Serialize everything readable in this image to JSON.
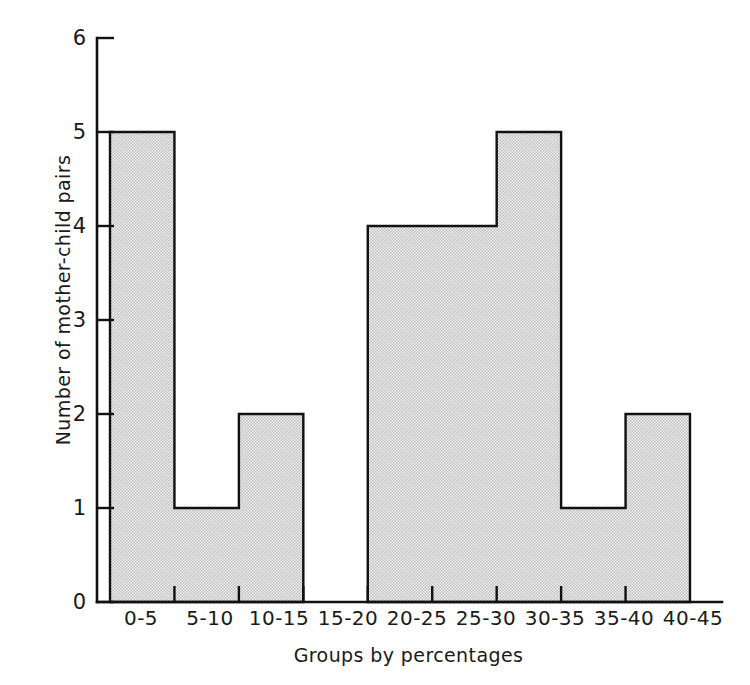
{
  "chart_data": {
    "type": "bar",
    "title": "",
    "xlabel": "Groups by percentages",
    "ylabel": "Number of mother-child pairs",
    "categories": [
      "0-5",
      "5-10",
      "10-15",
      "15-20",
      "20-25",
      "25-30",
      "30-35",
      "35-40",
      "40-45"
    ],
    "values": [
      5,
      1,
      2,
      0,
      4,
      4,
      5,
      1,
      2
    ],
    "ylim": [
      0,
      6
    ],
    "yticks": [
      "0",
      "1",
      "2",
      "3",
      "4",
      "5",
      "6"
    ],
    "ytick_values": [
      0,
      1,
      2,
      3,
      4,
      5,
      6
    ],
    "grid": false,
    "legend": null,
    "style": {
      "bar_fill": "#d6d6d6",
      "bar_edge": "#111111",
      "axis_color": "#111111",
      "background": "#ffffff",
      "fill_pattern": "halftone-dots"
    }
  }
}
